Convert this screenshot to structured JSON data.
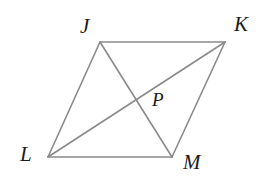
{
  "figure": {
    "kind": "parallelogram-with-diagonals",
    "background_color": "#ffffff",
    "stroke_color": "#8a8a8a",
    "stroke_width": 1.6,
    "label_color": "#1a1a1a",
    "canvas": {
      "width": 276,
      "height": 186
    },
    "vertices": {
      "J": {
        "label": "J",
        "x": 100,
        "y": 42
      },
      "K": {
        "label": "K",
        "x": 225,
        "y": 42
      },
      "L": {
        "label": "L",
        "x": 48,
        "y": 157
      },
      "M": {
        "label": "M",
        "x": 172,
        "y": 157
      },
      "P": {
        "label": "P",
        "x": 137,
        "y": 97
      }
    },
    "sides": [
      {
        "name": "JK",
        "from": "J",
        "to": "K"
      },
      {
        "name": "KM",
        "from": "K",
        "to": "M"
      },
      {
        "name": "ML",
        "from": "M",
        "to": "L"
      },
      {
        "name": "LJ",
        "from": "L",
        "to": "J"
      }
    ],
    "diagonals": [
      {
        "name": "JM",
        "from": "J",
        "to": "M"
      },
      {
        "name": "LK",
        "from": "L",
        "to": "K"
      }
    ],
    "intersection_point": "P"
  }
}
